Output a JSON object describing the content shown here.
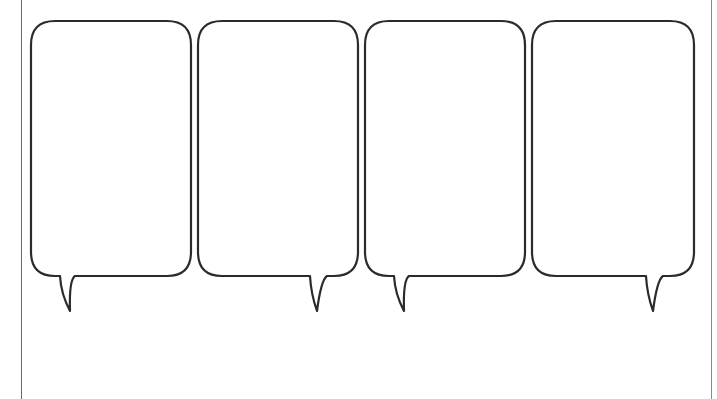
{
  "worksheet": {
    "title": "Four-panel speech bubble template",
    "line_color": "#2b2b2b",
    "background_color": "#ffffff",
    "bubbles": [
      {
        "id": "bubble-1",
        "tail_side": "left",
        "text": ""
      },
      {
        "id": "bubble-2",
        "tail_side": "right",
        "text": ""
      },
      {
        "id": "bubble-3",
        "tail_side": "left",
        "text": ""
      },
      {
        "id": "bubble-4",
        "tail_side": "right",
        "text": ""
      }
    ]
  }
}
